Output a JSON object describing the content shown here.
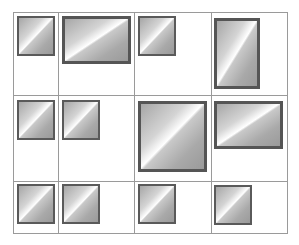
{
  "diagram": {
    "title": "",
    "grid": {
      "columns": 4,
      "rows": 3,
      "col_lines_x": [
        13,
        58,
        134,
        211,
        287
      ],
      "row_lines_y": [
        12,
        95,
        181,
        233
      ],
      "line_color": "#9a9a9a"
    },
    "style": {
      "box_border_color": "#5a5a5a",
      "gradient": "diagonal grey-white-grey"
    },
    "cells": [
      {
        "row": 0,
        "col": 0,
        "box": {
          "x": 17,
          "y": 16,
          "w": 38,
          "h": 40,
          "thick": false
        }
      },
      {
        "row": 0,
        "col": 1,
        "box": {
          "x": 62,
          "y": 16,
          "w": 69,
          "h": 48,
          "thick": true
        }
      },
      {
        "row": 0,
        "col": 2,
        "box": {
          "x": 138,
          "y": 16,
          "w": 38,
          "h": 40,
          "thick": false
        }
      },
      {
        "row": 0,
        "col": 3,
        "box": {
          "x": 214,
          "y": 18,
          "w": 46,
          "h": 71,
          "thick": true
        }
      },
      {
        "row": 1,
        "col": 0,
        "box": {
          "x": 17,
          "y": 100,
          "w": 38,
          "h": 40,
          "thick": false
        }
      },
      {
        "row": 1,
        "col": 1,
        "box": {
          "x": 62,
          "y": 100,
          "w": 38,
          "h": 40,
          "thick": false
        }
      },
      {
        "row": 1,
        "col": 2,
        "box": {
          "x": 138,
          "y": 101,
          "w": 69,
          "h": 71,
          "thick": true
        }
      },
      {
        "row": 1,
        "col": 3,
        "box": {
          "x": 214,
          "y": 101,
          "w": 69,
          "h": 48,
          "thick": true
        }
      },
      {
        "row": 2,
        "col": 0,
        "box": {
          "x": 17,
          "y": 184,
          "w": 38,
          "h": 40,
          "thick": false
        }
      },
      {
        "row": 2,
        "col": 1,
        "box": {
          "x": 62,
          "y": 184,
          "w": 38,
          "h": 40,
          "thick": false
        }
      },
      {
        "row": 2,
        "col": 2,
        "box": {
          "x": 138,
          "y": 184,
          "w": 38,
          "h": 40,
          "thick": false
        }
      },
      {
        "row": 2,
        "col": 3,
        "box": {
          "x": 214,
          "y": 185,
          "w": 38,
          "h": 40,
          "thick": false
        }
      }
    ]
  }
}
